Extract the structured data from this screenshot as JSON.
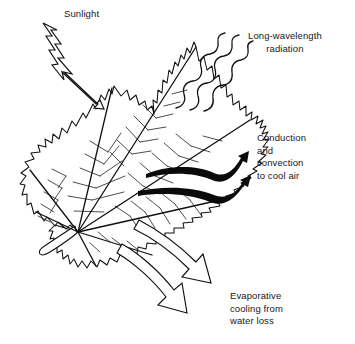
{
  "figure": {
    "background_color": "#ffffff",
    "ink_color": "#18181a",
    "line_color": "#000000"
  },
  "labels": {
    "sunlight": {
      "name": "sunlight",
      "lines": [
        "Sunlight"
      ],
      "text": "Sunlight",
      "align": "left"
    },
    "radiation": {
      "name": "long-wavelength-radiation",
      "lines": [
        "Long-wavelength",
        "radiation"
      ],
      "text": "Long-wavelength\nradiation",
      "align": "center"
    },
    "conduction": {
      "name": "conduction-and-convection",
      "lines": [
        "Conduction",
        "and",
        "convection",
        "to cool air"
      ],
      "text": "Conduction\nand\nconvection\nto cool air",
      "align": "left"
    },
    "evaporative": {
      "name": "evaporative-cooling",
      "lines": [
        "Evaporative",
        "cooling from",
        "water loss"
      ],
      "text": "Evaporative\ncooling from\nwater loss",
      "align": "left"
    }
  },
  "arrows": {
    "sunlight_arrow": {
      "style": "outlined-zigzag-bolt",
      "direction": "down-right",
      "fill": "#ffffff",
      "stroke": "#000000"
    },
    "radiation_waves": {
      "style": "wavy-lines",
      "count": 3,
      "direction": "up-right",
      "stroke": "#000000"
    },
    "convection_arrows": {
      "style": "solid-tapered-curve",
      "count": 2,
      "direction": "up-right",
      "fill": "#000000"
    },
    "evaporation_arrows": {
      "style": "outlined-block-arrow",
      "count": 2,
      "direction": "down-right",
      "fill": "#ffffff",
      "stroke": "#000000"
    }
  }
}
